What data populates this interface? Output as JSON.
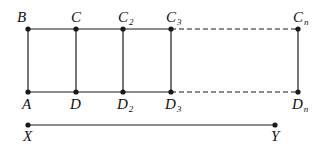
{
  "diagram": {
    "colors": {
      "stroke": "#1a1a1a",
      "text": "#111111",
      "background": "#ffffff"
    },
    "top_points": [
      {
        "id": "B",
        "label": "B",
        "sub": "",
        "x": 28,
        "y": 29
      },
      {
        "id": "C",
        "label": "C",
        "sub": "",
        "x": 76,
        "y": 29
      },
      {
        "id": "C2",
        "label": "C",
        "sub": "2",
        "x": 123,
        "y": 29
      },
      {
        "id": "C3",
        "label": "C",
        "sub": "3",
        "x": 171,
        "y": 29
      },
      {
        "id": "Cn",
        "label": "C",
        "sub": "n",
        "x": 298,
        "y": 29
      }
    ],
    "bottom_points": [
      {
        "id": "A",
        "label": "A",
        "sub": "",
        "x": 28,
        "y": 92
      },
      {
        "id": "D",
        "label": "D",
        "sub": "",
        "x": 76,
        "y": 92
      },
      {
        "id": "D2",
        "label": "D",
        "sub": "2",
        "x": 123,
        "y": 92
      },
      {
        "id": "D3",
        "label": "D",
        "sub": "3",
        "x": 171,
        "y": 92
      },
      {
        "id": "Dn",
        "label": "D",
        "sub": "n",
        "x": 298,
        "y": 92
      }
    ],
    "segment": {
      "start": {
        "id": "X",
        "label": "X",
        "x": 28,
        "y": 125
      },
      "end": {
        "id": "Y",
        "label": "Y",
        "x": 275,
        "y": 125
      }
    },
    "solid_until": "C3",
    "dashed_from": "C3",
    "dashed_to": "Cn"
  }
}
